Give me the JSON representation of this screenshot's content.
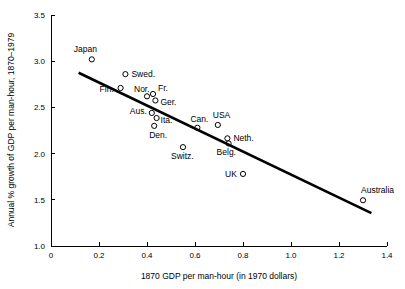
{
  "chart_data": {
    "type": "scatter",
    "title": "",
    "xlabel": "1870 GDP per man-hour (in 1970 dollars)",
    "ylabel": "Annual % growth of GDP per man-hour, 1870–1979",
    "xlim": [
      0,
      1.4
    ],
    "ylim": [
      1.0,
      3.5
    ],
    "xticks": [
      "0",
      "0.2",
      "0.4",
      "0.6",
      "0.8",
      "1.0",
      "1.2",
      "1.4"
    ],
    "xtick_values": [
      0,
      0.2,
      0.4,
      0.6,
      0.8,
      1.0,
      1.2,
      1.4
    ],
    "yticks": [
      "1.0",
      "1.5",
      "2.0",
      "2.5",
      "3.0",
      "3.5"
    ],
    "ytick_values": [
      1.0,
      1.5,
      2.0,
      2.5,
      3.0,
      3.5
    ],
    "grid": false,
    "legend": false,
    "marker": "open-circle",
    "points": [
      {
        "label": "Japan",
        "x": 0.17,
        "y": 3.02,
        "label_dx": -18,
        "label_dy": -7,
        "anchor": "start"
      },
      {
        "label": "Swed.",
        "x": 0.31,
        "y": 2.86,
        "label_dx": 6,
        "label_dy": 3,
        "anchor": "start"
      },
      {
        "label": "Fin.",
        "x": 0.29,
        "y": 2.71,
        "label_dx": -21,
        "label_dy": 4,
        "anchor": "start"
      },
      {
        "label": "Nor.",
        "x": 0.4,
        "y": 2.62,
        "label_dx": -13,
        "label_dy": -4,
        "anchor": "start"
      },
      {
        "label": "Fr.",
        "x": 0.425,
        "y": 2.645,
        "label_dx": 5,
        "label_dy": -3,
        "anchor": "start"
      },
      {
        "label": "Ger.",
        "x": 0.435,
        "y": 2.575,
        "label_dx": 5,
        "label_dy": 5,
        "anchor": "start"
      },
      {
        "label": "Aus.",
        "x": 0.42,
        "y": 2.44,
        "label_dx": -22,
        "label_dy": 1,
        "anchor": "start"
      },
      {
        "label": "Ita.",
        "x": 0.44,
        "y": 2.385,
        "label_dx": 4,
        "label_dy": 5,
        "anchor": "start"
      },
      {
        "label": "Den.",
        "x": 0.43,
        "y": 2.3,
        "label_dx": -5,
        "label_dy": 12,
        "anchor": "start"
      },
      {
        "label": "Switz.",
        "x": 0.55,
        "y": 2.07,
        "label_dx": -12,
        "label_dy": 12,
        "anchor": "start"
      },
      {
        "label": "Can.",
        "x": 0.61,
        "y": 2.28,
        "label_dx": -7,
        "label_dy": -6,
        "anchor": "start"
      },
      {
        "label": "USA",
        "x": 0.695,
        "y": 2.31,
        "label_dx": -5,
        "label_dy": -7,
        "anchor": "start"
      },
      {
        "label": "Neth.",
        "x": 0.735,
        "y": 2.165,
        "label_dx": 6,
        "label_dy": 3,
        "anchor": "start"
      },
      {
        "label": "Belg.",
        "x": 0.74,
        "y": 2.11,
        "label_dx": -12,
        "label_dy": 12,
        "anchor": "start"
      },
      {
        "label": "UK",
        "x": 0.8,
        "y": 1.78,
        "label_dx": -18,
        "label_dy": 3,
        "anchor": "start"
      },
      {
        "label": "Australia",
        "x": 1.3,
        "y": 1.495,
        "label_dx": -2,
        "label_dy": -7,
        "anchor": "start"
      }
    ],
    "trend_line": {
      "x1": 0.115,
      "y1": 2.875,
      "x2": 1.335,
      "y2": 1.355
    }
  },
  "plot_geometry": {
    "left_px": 51,
    "right_px": 387,
    "top_px": 15,
    "bottom_px": 246
  }
}
